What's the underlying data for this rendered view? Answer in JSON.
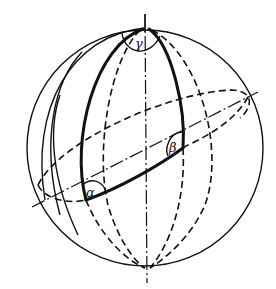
{
  "diagram": {
    "type": "spherical-triangle-on-sphere",
    "stroke_color": "#111111",
    "background": "#ffffff",
    "labels": {
      "alpha": "α",
      "beta": "β",
      "gamma": "γ"
    },
    "elements": [
      "sphere-outline",
      "vertical-axis",
      "tilted-axis",
      "equator-ellipse",
      "meridians-front",
      "meridians-back",
      "spherical-triangle",
      "angle-arcs"
    ]
  }
}
